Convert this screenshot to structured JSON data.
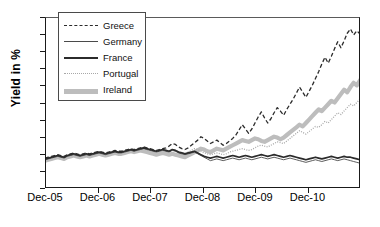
{
  "chart_data": {
    "type": "line",
    "title": "",
    "xlabel": "",
    "ylabel": "Yield in %",
    "ylim": [
      0,
      20
    ],
    "yticks": [
      0,
      2,
      4,
      6,
      8,
      10,
      12,
      14,
      16,
      18,
      20
    ],
    "xticklabels": [
      "Dec-05",
      "Dec-06",
      "Dec-07",
      "Dec-08",
      "Dec-09",
      "Dec-10"
    ],
    "xlim": [
      "Dec-05",
      "Dec-11"
    ],
    "grid": false,
    "legend_position": "top-left",
    "series": [
      {
        "name": "Greece",
        "style": "dashed",
        "color": "#2b2b2b",
        "values": [
          3.5,
          3.6,
          3.7,
          3.8,
          3.9,
          3.8,
          3.7,
          3.9,
          4.0,
          4.1,
          4.0,
          3.9,
          4.0,
          4.1,
          4.0,
          4.1,
          4.2,
          4.3,
          4.2,
          4.1,
          4.2,
          4.3,
          4.4,
          4.3,
          4.3,
          4.4,
          4.5,
          4.6,
          4.5,
          4.6,
          4.7,
          4.8,
          4.7,
          4.6,
          4.5,
          4.4,
          4.5,
          4.6,
          4.7,
          4.9,
          5.2,
          5.1,
          4.8,
          4.6,
          4.5,
          4.7,
          5.0,
          5.3,
          5.6,
          6.0,
          5.8,
          5.5,
          5.2,
          5.4,
          5.6,
          5.3,
          5.0,
          5.2,
          5.5,
          5.8,
          6.2,
          6.8,
          7.4,
          6.9,
          6.4,
          6.9,
          7.6,
          8.3,
          8.9,
          8.2,
          7.6,
          8.1,
          8.8,
          9.4,
          9.0,
          8.5,
          9.2,
          9.8,
          10.4,
          11.1,
          11.8,
          11.2,
          10.6,
          11.3,
          12.0,
          12.8,
          13.6,
          14.5,
          15.3,
          14.6,
          15.4,
          16.3,
          17.1,
          16.4,
          17.2,
          18.1,
          18.6,
          17.9,
          18.4,
          18.0
        ]
      },
      {
        "name": "Germany",
        "style": "thin-solid",
        "color": "#4a4a4a",
        "values": [
          3.3,
          3.4,
          3.5,
          3.6,
          3.7,
          3.6,
          3.5,
          3.7,
          3.8,
          3.9,
          3.8,
          3.7,
          3.8,
          3.9,
          3.8,
          3.9,
          4.0,
          4.1,
          4.0,
          3.9,
          4.0,
          4.1,
          4.2,
          4.1,
          4.1,
          4.2,
          4.3,
          4.4,
          4.3,
          4.4,
          4.5,
          4.6,
          4.5,
          4.4,
          4.3,
          4.2,
          4.3,
          4.4,
          4.3,
          4.2,
          4.4,
          4.3,
          4.1,
          4.0,
          3.9,
          4.0,
          4.1,
          4.2,
          4.0,
          3.8,
          3.6,
          3.4,
          3.2,
          3.3,
          3.4,
          3.3,
          3.2,
          3.3,
          3.4,
          3.5,
          3.4,
          3.3,
          3.4,
          3.5,
          3.4,
          3.3,
          3.4,
          3.5,
          3.6,
          3.5,
          3.4,
          3.5,
          3.6,
          3.5,
          3.4,
          3.3,
          3.4,
          3.5,
          3.4,
          3.3,
          3.2,
          3.1,
          3.0,
          3.1,
          3.2,
          3.3,
          3.2,
          3.1,
          3.2,
          3.3,
          3.4,
          3.3,
          3.2,
          3.3,
          3.4,
          3.3,
          3.2,
          3.1,
          3.0,
          2.9
        ]
      },
      {
        "name": "France",
        "style": "thick-solid",
        "color": "#2b2b2b",
        "values": [
          3.4,
          3.5,
          3.6,
          3.7,
          3.8,
          3.7,
          3.6,
          3.8,
          3.9,
          4.0,
          3.9,
          3.8,
          3.9,
          4.0,
          3.9,
          4.0,
          4.1,
          4.2,
          4.1,
          4.0,
          4.1,
          4.2,
          4.3,
          4.2,
          4.2,
          4.3,
          4.4,
          4.5,
          4.4,
          4.5,
          4.6,
          4.7,
          4.6,
          4.5,
          4.4,
          4.3,
          4.4,
          4.5,
          4.4,
          4.3,
          4.5,
          4.4,
          4.2,
          4.1,
          4.0,
          4.1,
          4.2,
          4.3,
          4.1,
          3.9,
          3.7,
          3.6,
          3.5,
          3.6,
          3.7,
          3.6,
          3.5,
          3.6,
          3.7,
          3.8,
          3.7,
          3.6,
          3.7,
          3.8,
          3.7,
          3.6,
          3.7,
          3.8,
          3.9,
          3.8,
          3.7,
          3.8,
          3.9,
          3.8,
          3.7,
          3.6,
          3.7,
          3.8,
          3.7,
          3.6,
          3.5,
          3.4,
          3.3,
          3.4,
          3.5,
          3.6,
          3.5,
          3.4,
          3.5,
          3.6,
          3.7,
          3.6,
          3.5,
          3.6,
          3.7,
          3.6,
          3.6,
          3.5,
          3.4,
          3.3
        ]
      },
      {
        "name": "Portugal",
        "style": "dotted",
        "color": "#a8a8a8",
        "values": [
          3.4,
          3.5,
          3.6,
          3.7,
          3.8,
          3.7,
          3.6,
          3.8,
          3.9,
          4.0,
          3.9,
          3.8,
          3.9,
          4.0,
          3.9,
          4.0,
          4.1,
          4.2,
          4.1,
          4.0,
          4.1,
          4.2,
          4.3,
          4.2,
          4.2,
          4.3,
          4.4,
          4.5,
          4.4,
          4.5,
          4.6,
          4.7,
          4.6,
          4.5,
          4.4,
          4.3,
          4.4,
          4.5,
          4.4,
          4.3,
          4.5,
          4.4,
          4.2,
          4.1,
          4.0,
          4.2,
          4.4,
          4.6,
          4.5,
          4.3,
          4.1,
          4.0,
          3.9,
          4.0,
          4.1,
          4.0,
          3.9,
          4.0,
          4.2,
          4.3,
          4.4,
          4.5,
          4.6,
          4.5,
          4.4,
          4.5,
          4.7,
          4.9,
          5.0,
          4.9,
          4.8,
          5.0,
          5.2,
          5.4,
          5.3,
          5.2,
          5.5,
          5.8,
          6.1,
          6.4,
          6.7,
          6.5,
          6.3,
          6.6,
          6.9,
          7.2,
          7.1,
          7.4,
          7.8,
          7.6,
          8.0,
          8.4,
          8.8,
          8.6,
          9.0,
          9.4,
          9.8,
          9.6,
          10.0,
          10.4
        ]
      },
      {
        "name": "Ireland",
        "style": "thick-gray",
        "color": "#bdbdbd",
        "values": [
          3.2,
          3.3,
          3.4,
          3.5,
          3.6,
          3.5,
          3.4,
          3.6,
          3.7,
          3.8,
          3.7,
          3.6,
          3.7,
          3.8,
          3.7,
          3.8,
          3.9,
          4.0,
          3.9,
          3.8,
          3.9,
          4.0,
          4.1,
          4.0,
          4.0,
          4.1,
          4.2,
          4.3,
          4.2,
          4.3,
          4.4,
          4.3,
          4.2,
          4.1,
          4.0,
          3.9,
          4.0,
          4.1,
          4.0,
          3.9,
          4.0,
          3.9,
          3.8,
          3.7,
          3.6,
          3.8,
          4.0,
          4.2,
          4.4,
          4.6,
          4.5,
          4.3,
          4.2,
          4.4,
          4.6,
          4.5,
          4.4,
          4.6,
          4.8,
          5.0,
          5.2,
          5.4,
          5.6,
          5.5,
          5.4,
          5.6,
          5.8,
          5.7,
          5.5,
          5.4,
          5.6,
          5.8,
          6.0,
          5.9,
          5.7,
          5.9,
          6.2,
          6.5,
          6.8,
          7.1,
          7.4,
          7.2,
          7.6,
          8.0,
          8.4,
          8.8,
          9.2,
          9.0,
          9.4,
          9.8,
          10.2,
          10.0,
          10.5,
          11.0,
          11.5,
          11.2,
          11.8,
          12.3,
          12.0,
          12.6
        ]
      }
    ]
  },
  "axis": {
    "ylabel": "Yield in %"
  }
}
